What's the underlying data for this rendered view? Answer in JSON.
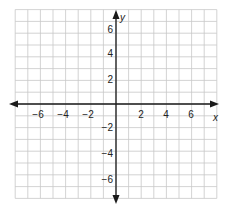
{
  "chart_data": {
    "type": "coordinate-plane",
    "title": "",
    "xlabel": "x",
    "ylabel": "y",
    "xlim": [
      -8,
      8
    ],
    "ylim": [
      -8,
      8
    ],
    "grid": true,
    "grid_step": 1,
    "x_tick_labels": [
      "-6",
      "-4",
      "-2",
      "2",
      "4",
      "6"
    ],
    "x_tick_values": [
      -6,
      -4,
      -2,
      2,
      4,
      6
    ],
    "y_tick_labels": [
      "6",
      "4",
      "2",
      "-2",
      "-4",
      "-6"
    ],
    "y_tick_values": [
      6,
      4,
      2,
      -2,
      -4,
      -6
    ],
    "series": []
  },
  "labels": {
    "x_axis": "x",
    "y_axis": "y",
    "x_ticks": [
      "−6",
      "−4",
      "−2",
      "2",
      "4",
      "6"
    ],
    "y_ticks": [
      "6",
      "4",
      "2",
      "−2",
      "−4",
      "−6"
    ]
  },
  "colors": {
    "grid": "#c8c8c8",
    "axis": "#1a1a1a",
    "text": "#222222",
    "background": "#ffffff"
  }
}
